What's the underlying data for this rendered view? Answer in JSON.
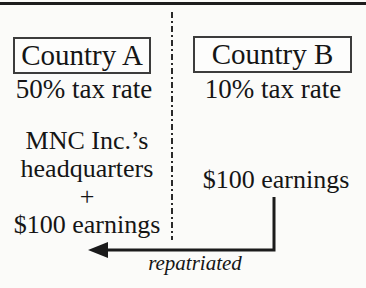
{
  "colors": {
    "background": "#fbfbf9",
    "ink": "#151515",
    "box_border": "#3c3c3c"
  },
  "left_panel": {
    "country_label": "Country A",
    "tax_rate": "50% tax rate",
    "lines": [
      "MNC Inc.’s",
      "headquarters",
      "+",
      "$100 earnings"
    ]
  },
  "right_panel": {
    "country_label": "Country B",
    "tax_rate": "10% tax rate",
    "earnings": "$100 earnings"
  },
  "arrow": {
    "label": "repatriated"
  }
}
